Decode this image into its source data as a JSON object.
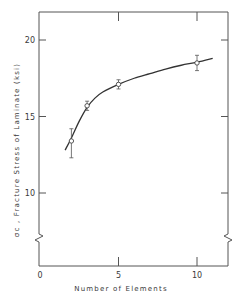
{
  "chart_data": {
    "type": "line",
    "title": "",
    "xlabel": "Number of Elements",
    "ylabel": "σc , Fracture Stress of Laminate (ksi)",
    "xlim": [
      0,
      12
    ],
    "ylim": [
      7,
      22
    ],
    "grid": false,
    "legend": null,
    "x_ticks": [
      0,
      5,
      10
    ],
    "x_tick_labels": [
      "0",
      "5",
      "10"
    ],
    "y_ticks": [
      10,
      15,
      20
    ],
    "y_tick_labels": [
      "10",
      "15",
      "20"
    ],
    "y_axis_break": true,
    "series": [
      {
        "name": "Measured",
        "style": "open-circle markers with error bars",
        "x": [
          2,
          3,
          5,
          10
        ],
        "values": [
          13.4,
          15.7,
          17.1,
          18.5
        ],
        "error_low": [
          12.3,
          15.4,
          16.8,
          18.0
        ],
        "error_high": [
          14.2,
          16.0,
          17.4,
          19.0
        ]
      },
      {
        "name": "Fitted curve",
        "style": "solid line",
        "x": [
          1.6,
          2,
          2.5,
          3,
          3.5,
          4,
          5,
          6,
          7,
          8,
          9,
          10,
          11
        ],
        "values": [
          12.8,
          13.6,
          14.7,
          15.6,
          16.2,
          16.6,
          17.1,
          17.5,
          17.8,
          18.1,
          18.35,
          18.55,
          18.8
        ]
      }
    ]
  }
}
